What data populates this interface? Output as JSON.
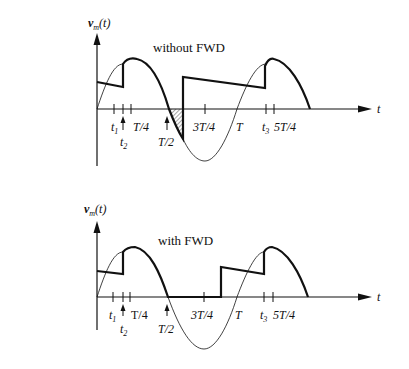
{
  "figure": {
    "panels": [
      {
        "id": "top",
        "ylabel": "v_m(t)",
        "ylabel_main": "v",
        "ylabel_sub": "m",
        "ylabel_suffix": "(t)",
        "xlabel": "t",
        "title": "without FWD",
        "ticks": [
          {
            "label": "t",
            "sub": "1"
          },
          {
            "label": "t",
            "sub": "2"
          },
          {
            "label": "T/4"
          },
          {
            "label": "T/2"
          },
          {
            "label": "3T/4"
          },
          {
            "label": "T"
          },
          {
            "label": "t",
            "sub": "3"
          },
          {
            "label": "5T/4"
          }
        ],
        "labels": {
          "t1": "t",
          "t1_sub": "1",
          "t2": "t",
          "t2_sub": "2",
          "tq": "T/4",
          "th": "T/2",
          "t3q": "3T/4",
          "tT": "T",
          "t3": "t",
          "t3_sub": "3",
          "t5q": "5T/4"
        },
        "shaded_region": "hatched area between T/2 and commutation point"
      },
      {
        "id": "bottom",
        "ylabel": "v_m(t)",
        "ylabel_main": "v",
        "ylabel_sub": "m",
        "ylabel_suffix": "(t)",
        "xlabel": "t",
        "title": "with FWD",
        "labels": {
          "t1": "t",
          "t1_sub": "1",
          "t2": "t",
          "t2_sub": "2",
          "tq": "T/4",
          "th": "T/2",
          "t3q": "3T/4",
          "tT": "T",
          "t3": "t",
          "t3_sub": "3",
          "t5q": "5T/4"
        }
      }
    ]
  }
}
